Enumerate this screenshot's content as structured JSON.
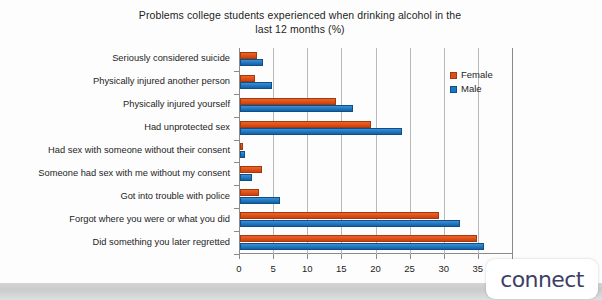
{
  "chart_data": {
    "type": "bar",
    "orientation": "horizontal",
    "title": "Problems college students experienced when drinking alcohol in the last 12 months (%)",
    "title_line1": "Problems college students experienced when drinking alcohol in the",
    "title_line2": "last 12 months (%)",
    "xlabel": "",
    "ylabel": "",
    "xlim": [
      0,
      40
    ],
    "xticks": [
      0,
      5,
      10,
      15,
      20,
      25,
      30,
      35,
      40
    ],
    "xtick_labels": [
      "0",
      "5",
      "10",
      "15",
      "20",
      "25",
      "30",
      "35",
      "40"
    ],
    "grid": true,
    "legend_position": "upper right",
    "categories": [
      "Seriously considered suicide",
      "Physically injured another person",
      "Physically injured yourself",
      "Had unprotected sex",
      "Had sex with someone without their consent",
      "Someone had sex with me without my consent",
      "Got into trouble with police",
      "Forgot where you were or what you did",
      "Did something you later regretted"
    ],
    "series": [
      {
        "name": "Female",
        "color": "#df4f18",
        "values": [
          2.5,
          2.2,
          14.0,
          19.2,
          0.4,
          3.2,
          2.8,
          29.1,
          34.7
        ]
      },
      {
        "name": "Male",
        "color": "#1f76c2",
        "values": [
          3.4,
          4.7,
          16.5,
          23.8,
          0.7,
          1.8,
          5.9,
          32.3,
          35.8
        ]
      }
    ]
  },
  "legend": {
    "items": [
      {
        "label": "Female"
      },
      {
        "label": "Male"
      }
    ]
  },
  "logo": {
    "text": "connect"
  }
}
